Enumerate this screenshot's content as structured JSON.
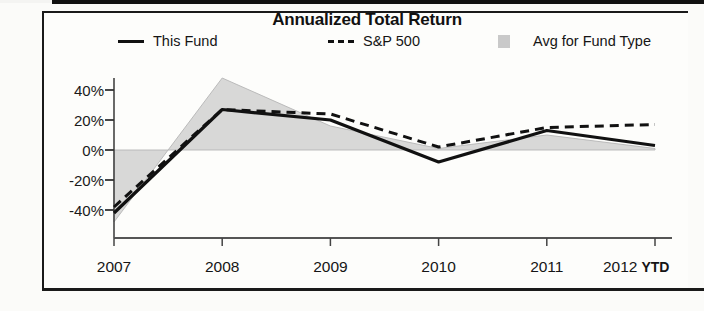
{
  "document": {
    "panel_title": "Annualized Total Return"
  },
  "legend": {
    "items": [
      {
        "label": "This Fund",
        "marker": "solid-line-swatch",
        "color": "#111111"
      },
      {
        "label": "S&P 500",
        "marker": "dashed-line-swatch",
        "color": "#111111"
      },
      {
        "label": "Avg for Fund Type",
        "marker": "area-swatch",
        "color": "#c9c9c9"
      }
    ]
  },
  "axes": {
    "y_ticks": [
      "40%",
      "20%",
      "0%",
      "-20%",
      "-40%"
    ],
    "x_ticks": [
      "2007",
      "2008",
      "2009",
      "2010",
      "2011",
      "2012"
    ],
    "x_last_suffix": "YTD"
  },
  "chart_data": {
    "type": "line",
    "title": "Annualized Total Return",
    "xlabel": "",
    "ylabel": "",
    "ylim": [
      -50,
      50
    ],
    "ytick_values": [
      40,
      20,
      0,
      -20,
      -40
    ],
    "grid": false,
    "legend_position": "top",
    "categories": [
      "2007",
      "2008",
      "2009",
      "2010",
      "2011",
      "2012 YTD"
    ],
    "series": [
      {
        "name": "This Fund",
        "style": "solid",
        "color": "#111111",
        "values": [
          -42,
          27,
          20,
          -8,
          13,
          3
        ]
      },
      {
        "name": "S&P 500",
        "style": "dashed",
        "color": "#111111",
        "values": [
          -38,
          27,
          24,
          2,
          15,
          17
        ]
      },
      {
        "name": "Avg for Fund Type",
        "style": "area",
        "color": "#c9c9c9",
        "values": [
          -48,
          48,
          16,
          1,
          10,
          1
        ]
      }
    ]
  }
}
